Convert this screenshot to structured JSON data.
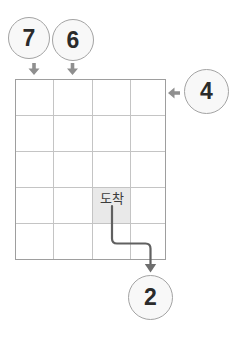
{
  "grid": {
    "columns": 4,
    "rows": 5
  },
  "arrival_label": "도착",
  "circles": {
    "c7": {
      "label": "7"
    },
    "c6": {
      "label": "6"
    },
    "c4": {
      "label": "4"
    },
    "c2": {
      "label": "2"
    }
  },
  "colors": {
    "circle_fill": "#f8f8f8",
    "circle_border": "#a3a3a3",
    "number_text": "#2b2b2b",
    "grid_border": "#9e9e9e",
    "grid_line": "#c4c4c4",
    "arrival_cell_fill": "#e9e9e9",
    "entry_arrow": "#8f8f8f",
    "path_line": "#606060",
    "exit_arrow": "#6e6e6e"
  }
}
